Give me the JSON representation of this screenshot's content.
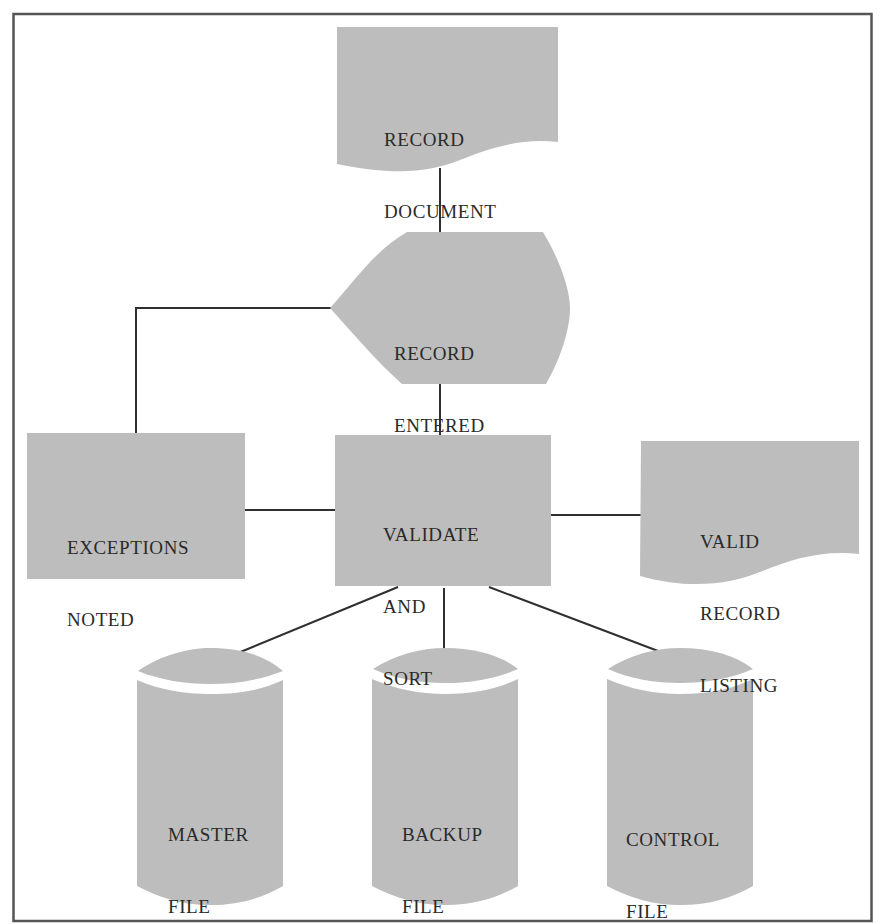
{
  "diagram": {
    "type": "system-flowchart",
    "colors": {
      "fill": "#bdbdbd",
      "stroke": "#2f2f2f",
      "frame": "#555555",
      "text": "#2a2a2a",
      "background": "#ffffff"
    },
    "nodes": {
      "record_document": {
        "shape": "document",
        "line1": "RECORD",
        "line2": "DOCUMENT"
      },
      "record_entered": {
        "shape": "display",
        "line1": "RECORD",
        "line2": "ENTERED"
      },
      "exceptions_noted": {
        "shape": "process",
        "line1": "EXCEPTIONS",
        "line2": "NOTED"
      },
      "validate_and_sort": {
        "shape": "process",
        "line1": "VALIDATE",
        "line2": "AND",
        "line3": "SORT"
      },
      "valid_record_listing": {
        "shape": "document",
        "line1": "VALID",
        "line2": "RECORD",
        "line3": "LISTING"
      },
      "master_file": {
        "shape": "disk-storage",
        "line1": "MASTER",
        "line2": "FILE"
      },
      "backup_file": {
        "shape": "disk-storage",
        "line1": "BACKUP",
        "line2": "FILE"
      },
      "control_file": {
        "shape": "disk-storage",
        "line1": "CONTROL",
        "line2": "FILE"
      }
    },
    "edges": [
      {
        "from": "record_document",
        "to": "record_entered"
      },
      {
        "from": "record_entered",
        "to": "exceptions_noted"
      },
      {
        "from": "record_entered",
        "to": "validate_and_sort"
      },
      {
        "from": "exceptions_noted",
        "to": "validate_and_sort"
      },
      {
        "from": "validate_and_sort",
        "to": "valid_record_listing"
      },
      {
        "from": "validate_and_sort",
        "to": "master_file"
      },
      {
        "from": "validate_and_sort",
        "to": "backup_file"
      },
      {
        "from": "validate_and_sort",
        "to": "control_file"
      }
    ]
  }
}
